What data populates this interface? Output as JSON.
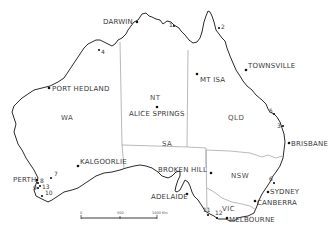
{
  "map": {
    "title": "Australia",
    "cities": [
      {
        "id": "darwin",
        "label": "DARWIN"
      },
      {
        "id": "port-hedland",
        "label": "PORT HEDLAND"
      },
      {
        "id": "alice-springs",
        "label": "ALICE SPRINGS"
      },
      {
        "id": "mt-isa",
        "label": "MT ISA"
      },
      {
        "id": "townsville",
        "label": "TOWNSVILLE"
      },
      {
        "id": "brisbane",
        "label": "BRISBANE"
      },
      {
        "id": "kalgoorlie",
        "label": "KALGOORLIE"
      },
      {
        "id": "broken-hill",
        "label": "BROKEN HILL"
      },
      {
        "id": "adelaide",
        "label": "ADELAIDE"
      },
      {
        "id": "sydney",
        "label": "SYDNEY"
      },
      {
        "id": "canberra",
        "label": "CANBERRA"
      },
      {
        "id": "melbourne",
        "label": "MELBOURNE"
      },
      {
        "id": "perth",
        "label": "PERTH"
      }
    ],
    "states": [
      {
        "id": "wa",
        "label": "WA"
      },
      {
        "id": "nt",
        "label": "NT"
      },
      {
        "id": "qld",
        "label": "QLD"
      },
      {
        "id": "sa",
        "label": "SA"
      },
      {
        "id": "nsw",
        "label": "NSW"
      },
      {
        "id": "vic",
        "label": "VIC"
      }
    ],
    "sites": [
      "1",
      "2",
      "3",
      "4",
      "5",
      "6",
      "7",
      "8",
      "9",
      "10",
      "11",
      "12",
      "13"
    ],
    "scale_bar": {
      "ticks": [
        "0",
        "500",
        "1000 Km"
      ]
    }
  }
}
